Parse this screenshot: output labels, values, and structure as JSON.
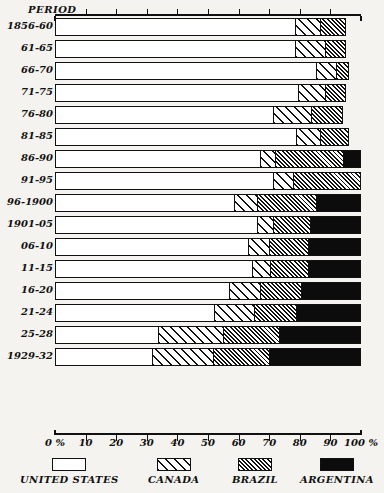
{
  "chart_data": {
    "type": "bar",
    "orientation": "horizontal",
    "stacked": true,
    "stack_normalized": true,
    "title": "",
    "xlabel": "",
    "ylabel": "PERIOD",
    "xlim": [
      0,
      100
    ],
    "xticks": [
      0,
      10,
      20,
      30,
      40,
      50,
      60,
      70,
      80,
      90,
      100
    ],
    "xtick_labels": [
      "0 %",
      "10",
      "20",
      "30",
      "40",
      "50",
      "60",
      "70",
      "80",
      "90",
      "100 %"
    ],
    "grid": false,
    "legend_position": "bottom",
    "categories": [
      "1856-60",
      "61-65",
      "66-70",
      "71-75",
      "76-80",
      "81-85",
      "86-90",
      "91-95",
      "96-1900",
      "1901-05",
      "06-10",
      "11-15",
      "16-20",
      "21-24",
      "25-28",
      "1929-32"
    ],
    "series": [
      {
        "name": "UNITED STATES",
        "pattern": "blank",
        "color": "#ffffff",
        "values": [
          78.5,
          78.5,
          85.5,
          79.5,
          71.5,
          79.0,
          67.0,
          71.5,
          58.5,
          66.0,
          63.0,
          64.5,
          57.0,
          52.0,
          33.5,
          31.5
        ]
      },
      {
        "name": "CANADA",
        "pattern": "wide-diagonal-hatch",
        "color": "#ffffff",
        "values": [
          8.5,
          10.0,
          6.5,
          9.0,
          12.5,
          8.0,
          5.0,
          6.5,
          7.5,
          5.5,
          7.0,
          6.0,
          10.0,
          13.0,
          21.5,
          20.0
        ]
      },
      {
        "name": "BRAZIL",
        "pattern": "dense-diagonal-hatch",
        "color": "#ffffff",
        "values": [
          8.0,
          6.5,
          4.0,
          6.5,
          10.0,
          9.0,
          22.5,
          22.0,
          19.5,
          12.0,
          13.0,
          12.5,
          13.5,
          14.0,
          18.5,
          18.5
        ]
      },
      {
        "name": "ARGENTINA",
        "pattern": "solid-black",
        "color": "#0c0c0c",
        "values": [
          0.0,
          0.0,
          0.0,
          0.0,
          0.0,
          0.0,
          5.5,
          0.0,
          14.5,
          16.5,
          17.0,
          17.0,
          19.5,
          21.0,
          26.5,
          30.0
        ]
      }
    ],
    "bar_totals": [
      95.0,
      95.0,
      96.0,
      95.0,
      94.0,
      96.0,
      100.0,
      100.0,
      100.0,
      100.0,
      100.0,
      100.0,
      100.0,
      100.0,
      100.0,
      100.0
    ]
  },
  "axis": {
    "period_header": "PERIOD"
  },
  "legend": {
    "items": [
      {
        "label": "UNITED STATES",
        "swatch": "us"
      },
      {
        "label": "CANADA",
        "swatch": "ca"
      },
      {
        "label": "BRAZIL",
        "swatch": "br"
      },
      {
        "label": "ARGENTINA",
        "swatch": "ar"
      }
    ]
  }
}
